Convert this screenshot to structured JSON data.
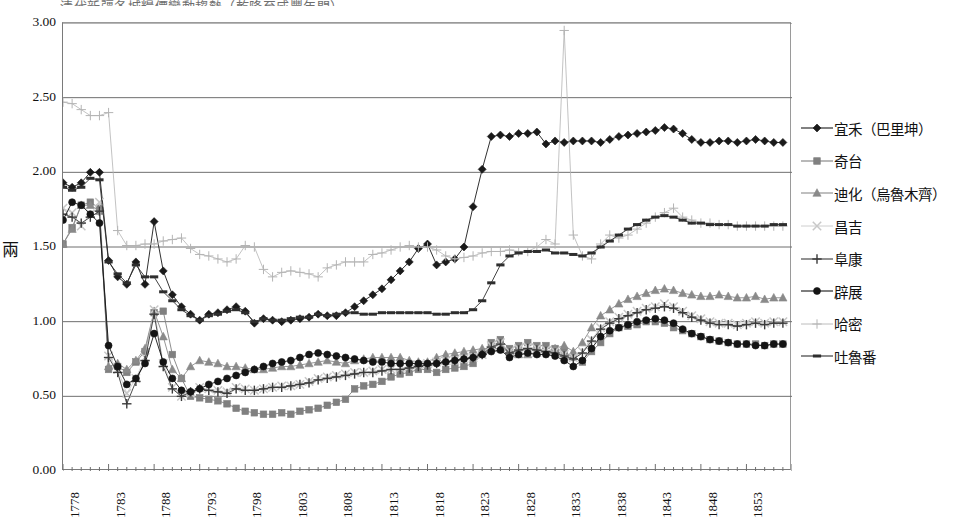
{
  "title_partial": "清代新疆各城糧價變動趨勢（乾隆至咸豐年間）",
  "axes": {
    "ylabel": "兩",
    "yticks": [
      "0.00",
      "0.50",
      "1.00",
      "1.50",
      "2.00",
      "2.50",
      "3.00"
    ],
    "xticks": [
      "1778",
      "1783",
      "1788",
      "1793",
      "1798",
      "1803",
      "1808",
      "1813",
      "1818",
      "1823",
      "1828",
      "1833",
      "1838",
      "1843",
      "1848",
      "1853"
    ]
  },
  "legend": {
    "items": [
      {
        "label": "宜禾（巴里坤）",
        "marker": "diamond",
        "color": "#1a1a1a",
        "name": "yihe"
      },
      {
        "label": "奇台",
        "marker": "square",
        "color": "#808080",
        "name": "qitai"
      },
      {
        "label": "迪化（烏魯木齊）",
        "marker": "triangle",
        "color": "#8a8a8a",
        "name": "dihua"
      },
      {
        "label": "昌吉",
        "marker": "cross-x",
        "color": "#c8c8c8",
        "name": "changji"
      },
      {
        "label": "阜康",
        "marker": "plus",
        "color": "#3a3a3a",
        "name": "fukang"
      },
      {
        "label": "辟展",
        "marker": "circle",
        "color": "#141414",
        "name": "pizhan"
      },
      {
        "label": "哈密",
        "marker": "plus-light",
        "color": "#b4b4b4",
        "name": "hami"
      },
      {
        "label": "吐魯番",
        "marker": "dash",
        "color": "#2e2e2e",
        "name": "tulufan"
      }
    ]
  },
  "chart_data": {
    "type": "line",
    "title": "清代新疆各城糧價變動趨勢（乾隆至咸豐年間）",
    "xlabel": "",
    "ylabel": "兩",
    "ylim": [
      0.0,
      3.0
    ],
    "xlim": [
      1778,
      1858
    ],
    "grid": "horizontal",
    "legend_position": "right",
    "x": [
      1778,
      1779,
      1780,
      1781,
      1782,
      1783,
      1784,
      1785,
      1786,
      1787,
      1788,
      1789,
      1790,
      1791,
      1792,
      1793,
      1794,
      1795,
      1796,
      1797,
      1798,
      1799,
      1800,
      1801,
      1802,
      1803,
      1804,
      1805,
      1806,
      1807,
      1808,
      1809,
      1810,
      1811,
      1812,
      1813,
      1814,
      1815,
      1816,
      1817,
      1818,
      1819,
      1820,
      1821,
      1822,
      1823,
      1824,
      1825,
      1826,
      1827,
      1828,
      1829,
      1830,
      1831,
      1832,
      1833,
      1834,
      1835,
      1836,
      1837,
      1838,
      1839,
      1840,
      1841,
      1842,
      1843,
      1844,
      1845,
      1846,
      1847,
      1848,
      1849,
      1850,
      1851,
      1852,
      1853,
      1854,
      1855,
      1856,
      1857
    ],
    "series": [
      {
        "name": "宜禾（巴里坤）",
        "marker": "diamond",
        "color": "#1a1a1a",
        "values": [
          1.93,
          1.9,
          1.93,
          2.0,
          2.0,
          1.41,
          1.3,
          1.25,
          1.4,
          1.25,
          1.67,
          1.34,
          1.18,
          1.1,
          1.05,
          1.01,
          1.05,
          1.06,
          1.08,
          1.1,
          1.07,
          0.99,
          1.02,
          1.01,
          1.0,
          1.01,
          1.02,
          1.03,
          1.05,
          1.04,
          1.04,
          1.06,
          1.1,
          1.14,
          1.18,
          1.22,
          1.28,
          1.34,
          1.4,
          1.49,
          1.52,
          1.38,
          1.4,
          1.42,
          1.5,
          1.77,
          2.02,
          2.24,
          2.25,
          2.24,
          2.26,
          2.26,
          2.27,
          2.19,
          2.21,
          2.2,
          2.21,
          2.21,
          2.21,
          2.2,
          2.22,
          2.24,
          2.25,
          2.26,
          2.27,
          2.28,
          2.3,
          2.29,
          2.26,
          2.22,
          2.2,
          2.2,
          2.21,
          2.21,
          2.2,
          2.21,
          2.22,
          2.21,
          2.2,
          2.2
        ]
      },
      {
        "name": "奇台",
        "marker": "square",
        "color": "#808080",
        "values": [
          1.52,
          1.63,
          1.78,
          1.8,
          1.76,
          0.68,
          0.7,
          0.66,
          0.73,
          0.8,
          1.06,
          1.07,
          0.78,
          0.62,
          0.5,
          0.49,
          0.48,
          0.47,
          0.45,
          0.42,
          0.4,
          0.39,
          0.38,
          0.38,
          0.39,
          0.38,
          0.4,
          0.41,
          0.42,
          0.44,
          0.46,
          0.48,
          0.55,
          0.57,
          0.58,
          0.6,
          0.63,
          0.65,
          0.66,
          0.68,
          0.68,
          0.66,
          0.68,
          0.69,
          0.7,
          0.72,
          0.78,
          0.86,
          0.88,
          0.82,
          0.84,
          0.86,
          0.84,
          0.84,
          0.82,
          0.8,
          0.76,
          0.73,
          0.8,
          0.86,
          0.92,
          0.96,
          0.97,
          0.98,
          1.0,
          1.0,
          0.99,
          0.96,
          0.94,
          0.92,
          0.9,
          0.88,
          0.87,
          0.86,
          0.85,
          0.85,
          0.85,
          0.84,
          0.85,
          0.85
        ]
      },
      {
        "name": "迪化（烏魯木齊）",
        "marker": "triangle",
        "color": "#8a8a8a",
        "values": [
          1.52,
          1.62,
          1.78,
          1.78,
          1.74,
          0.7,
          0.72,
          0.68,
          0.74,
          0.82,
          1.07,
          0.9,
          0.68,
          0.62,
          0.7,
          0.74,
          0.73,
          0.72,
          0.7,
          0.7,
          0.69,
          0.68,
          0.68,
          0.69,
          0.7,
          0.7,
          0.71,
          0.72,
          0.73,
          0.74,
          0.73,
          0.72,
          0.74,
          0.75,
          0.76,
          0.76,
          0.76,
          0.76,
          0.74,
          0.73,
          0.73,
          0.76,
          0.78,
          0.79,
          0.8,
          0.81,
          0.82,
          0.82,
          0.82,
          0.8,
          0.78,
          0.78,
          0.79,
          0.8,
          0.82,
          0.84,
          0.8,
          0.86,
          0.96,
          1.04,
          1.08,
          1.12,
          1.15,
          1.17,
          1.19,
          1.21,
          1.22,
          1.21,
          1.19,
          1.18,
          1.17,
          1.17,
          1.18,
          1.17,
          1.16,
          1.16,
          1.17,
          1.15,
          1.16,
          1.16
        ]
      },
      {
        "name": "昌吉",
        "marker": "cross-x",
        "color": "#c8c8c8",
        "values": [
          1.76,
          1.73,
          1.64,
          1.72,
          1.8,
          0.77,
          0.68,
          0.52,
          0.62,
          0.76,
          1.08,
          0.72,
          0.56,
          0.5,
          0.52,
          0.56,
          0.55,
          0.54,
          0.53,
          0.56,
          0.55,
          0.54,
          0.55,
          0.56,
          0.57,
          0.57,
          0.58,
          0.6,
          0.62,
          0.63,
          0.64,
          0.65,
          0.66,
          0.66,
          0.67,
          0.68,
          0.68,
          0.69,
          0.7,
          0.71,
          0.72,
          0.73,
          0.74,
          0.74,
          0.75,
          0.76,
          0.78,
          0.84,
          0.86,
          0.8,
          0.82,
          0.83,
          0.82,
          0.81,
          0.8,
          0.78,
          0.76,
          0.8,
          0.88,
          0.96,
          1.0,
          1.03,
          1.05,
          1.07,
          1.09,
          1.1,
          1.12,
          1.1,
          1.07,
          1.04,
          1.02,
          1.0,
          0.99,
          0.99,
          0.98,
          0.99,
          1.0,
          0.99,
          1.0,
          1.0
        ]
      },
      {
        "name": "阜康",
        "marker": "plus",
        "color": "#3a3a3a",
        "values": [
          1.72,
          1.7,
          1.66,
          1.7,
          1.74,
          0.76,
          0.66,
          0.45,
          0.6,
          0.74,
          1.05,
          0.7,
          0.55,
          0.5,
          0.53,
          0.55,
          0.54,
          0.53,
          0.52,
          0.55,
          0.54,
          0.54,
          0.55,
          0.56,
          0.56,
          0.57,
          0.58,
          0.59,
          0.61,
          0.62,
          0.63,
          0.64,
          0.65,
          0.66,
          0.66,
          0.67,
          0.68,
          0.68,
          0.69,
          0.7,
          0.71,
          0.72,
          0.73,
          0.74,
          0.75,
          0.76,
          0.78,
          0.83,
          0.85,
          0.79,
          0.81,
          0.82,
          0.81,
          0.8,
          0.79,
          0.77,
          0.75,
          0.79,
          0.87,
          0.95,
          0.99,
          1.02,
          1.04,
          1.06,
          1.08,
          1.09,
          1.1,
          1.09,
          1.06,
          1.03,
          1.01,
          0.99,
          0.98,
          0.98,
          0.97,
          0.98,
          0.99,
          0.98,
          0.99,
          0.99
        ]
      },
      {
        "name": "辟展",
        "marker": "circle",
        "color": "#141414",
        "values": [
          1.68,
          1.8,
          1.78,
          1.72,
          1.66,
          0.84,
          0.7,
          0.58,
          0.62,
          0.72,
          0.92,
          0.73,
          0.62,
          0.54,
          0.53,
          0.55,
          0.58,
          0.6,
          0.62,
          0.64,
          0.66,
          0.68,
          0.7,
          0.72,
          0.73,
          0.74,
          0.76,
          0.78,
          0.79,
          0.78,
          0.77,
          0.76,
          0.75,
          0.74,
          0.73,
          0.73,
          0.72,
          0.72,
          0.72,
          0.72,
          0.72,
          0.72,
          0.73,
          0.74,
          0.75,
          0.76,
          0.78,
          0.8,
          0.81,
          0.76,
          0.78,
          0.79,
          0.78,
          0.78,
          0.77,
          0.74,
          0.7,
          0.74,
          0.82,
          0.9,
          0.94,
          0.96,
          0.98,
          1.0,
          1.01,
          1.02,
          1.01,
          0.99,
          0.95,
          0.92,
          0.9,
          0.88,
          0.87,
          0.86,
          0.85,
          0.85,
          0.84,
          0.84,
          0.85,
          0.85
        ]
      },
      {
        "name": "哈密",
        "marker": "plus-light",
        "color": "#b4b4b4",
        "values": [
          2.47,
          2.46,
          2.42,
          2.38,
          2.38,
          2.4,
          1.61,
          1.51,
          1.51,
          1.52,
          1.52,
          1.54,
          1.55,
          1.56,
          1.49,
          1.45,
          1.44,
          1.42,
          1.4,
          1.42,
          1.51,
          1.5,
          1.35,
          1.3,
          1.33,
          1.34,
          1.33,
          1.32,
          1.3,
          1.36,
          1.38,
          1.4,
          1.4,
          1.4,
          1.45,
          1.46,
          1.48,
          1.5,
          1.51,
          1.5,
          1.5,
          1.48,
          1.44,
          1.42,
          1.43,
          1.44,
          1.46,
          1.47,
          1.47,
          1.48,
          1.47,
          1.47,
          1.5,
          1.55,
          1.52,
          2.95,
          1.58,
          1.44,
          1.42,
          1.52,
          1.58,
          1.56,
          1.58,
          1.62,
          1.66,
          1.7,
          1.73,
          1.76,
          1.7,
          1.68,
          1.66,
          1.66,
          1.65,
          1.65,
          1.64,
          1.64,
          1.64,
          1.64,
          1.64,
          1.64
        ]
      },
      {
        "name": "吐魯番",
        "marker": "dash",
        "color": "#2e2e2e",
        "values": [
          1.9,
          1.88,
          1.9,
          1.96,
          1.95,
          1.4,
          1.32,
          1.26,
          1.38,
          1.3,
          1.3,
          1.2,
          1.14,
          1.08,
          1.04,
          1.01,
          1.04,
          1.05,
          1.07,
          1.08,
          1.06,
          1.0,
          1.02,
          1.01,
          1.01,
          1.02,
          1.03,
          1.03,
          1.05,
          1.04,
          1.05,
          1.06,
          1.06,
          1.05,
          1.05,
          1.06,
          1.06,
          1.06,
          1.06,
          1.06,
          1.06,
          1.05,
          1.05,
          1.06,
          1.06,
          1.08,
          1.14,
          1.26,
          1.38,
          1.44,
          1.46,
          1.47,
          1.47,
          1.48,
          1.46,
          1.46,
          1.45,
          1.44,
          1.46,
          1.5,
          1.54,
          1.58,
          1.62,
          1.65,
          1.68,
          1.7,
          1.71,
          1.7,
          1.68,
          1.66,
          1.66,
          1.65,
          1.65,
          1.65,
          1.64,
          1.64,
          1.64,
          1.64,
          1.65,
          1.65
        ]
      }
    ]
  }
}
